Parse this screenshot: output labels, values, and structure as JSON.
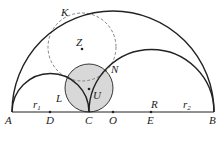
{
  "diagram": {
    "type": "arbelos",
    "colors": {
      "stroke": "#222222",
      "fill_circle": "#d8d8d8",
      "dashed": "#777777"
    },
    "labels": {
      "K": "K",
      "Z": "Z",
      "L": "L",
      "N": "N",
      "U": "U",
      "A": "A",
      "D": "D",
      "C": "C",
      "O": "O",
      "E": "E",
      "B": "B",
      "R": "R",
      "r1_base": "r",
      "r1_sub": "1",
      "r2_base": "r",
      "r2_sub": "2"
    },
    "caption": ""
  }
}
